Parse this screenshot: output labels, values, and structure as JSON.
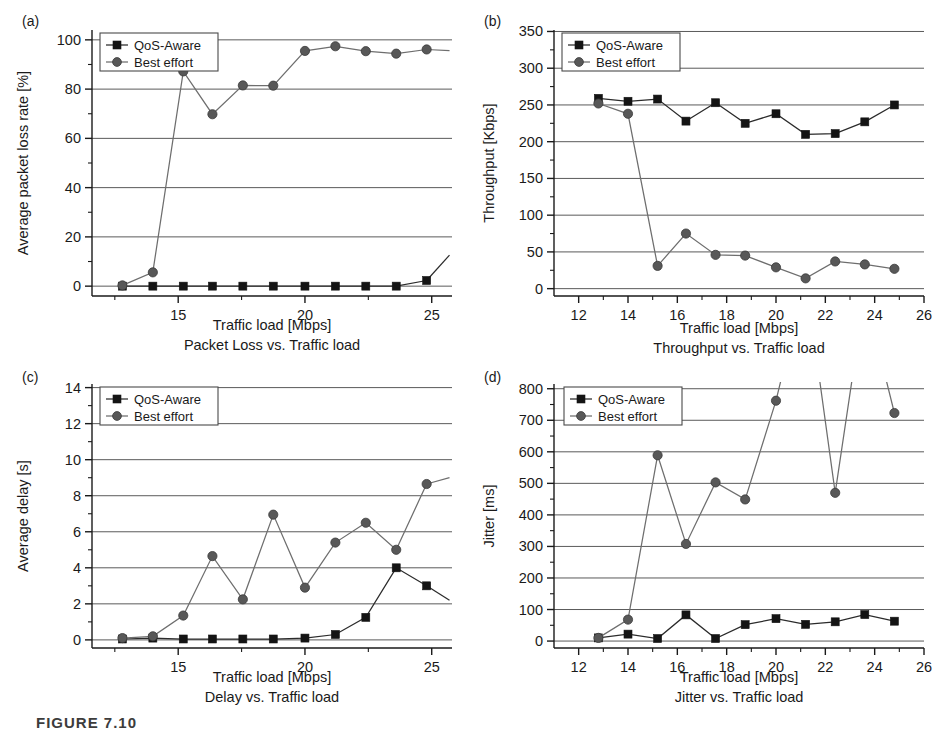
{
  "figure": {
    "caption_partial": "FIGURE 7.10",
    "series_names": [
      "QoS-Aware",
      "Best effort"
    ],
    "colors": {
      "qos_aware_marker": "#141414",
      "best_effort_marker": "#585858",
      "gridline": "#5a5a5a",
      "axis": "#1a1a1a",
      "background": "#ffffff"
    }
  },
  "chart_data": [
    {
      "id": "panel-a",
      "panel_tag": "(a)",
      "type": "line",
      "title": "",
      "sub_caption": "Packet Loss vs. Traffic load",
      "xlabel": "Traffic load [Mbps]",
      "ylabel": "Average packet loss rate [%]",
      "xlim": [
        11.6,
        25.8
      ],
      "ylim": [
        -4,
        104
      ],
      "xticks": [
        15,
        20,
        25
      ],
      "xtick_labels": [
        "15",
        "20",
        "25"
      ],
      "xminor": [
        12.5,
        17.5,
        22.5
      ],
      "yticks": [
        0,
        20,
        40,
        60,
        80,
        100
      ],
      "ytick_labels": [
        "0",
        "20",
        "40",
        "60",
        "80",
        "100"
      ],
      "yminor": [
        10,
        30,
        50,
        70,
        90
      ],
      "grid": true,
      "legend_position": "top-left",
      "x": [
        12.8,
        14.0,
        15.2,
        16.35,
        17.55,
        18.75,
        20.0,
        21.2,
        22.4,
        23.6,
        24.8
      ],
      "series": [
        {
          "name": "QoS-Aware",
          "marker": "square",
          "values": [
            0,
            0,
            0,
            0,
            0,
            0,
            0,
            0,
            0,
            0,
            2.3
          ]
        },
        {
          "name": "Best effort",
          "marker": "circle",
          "values": [
            0.3,
            5.6,
            87.2,
            69.8,
            81.5,
            81.4,
            95.5,
            97.4,
            95.4,
            94.4,
            96.1
          ]
        }
      ],
      "extra_segments": [
        {
          "series": "QoS-Aware",
          "note": "rises off panel after last point",
          "x": [
            24.8,
            25.7
          ],
          "y": [
            2.3,
            12.6
          ]
        },
        {
          "series": "Best effort",
          "note": "continues to right edge",
          "x": [
            24.8,
            25.7
          ],
          "y": [
            96.1,
            95.6
          ]
        }
      ]
    },
    {
      "id": "panel-b",
      "panel_tag": "(b)",
      "type": "line",
      "title": "",
      "sub_caption": "Throughput vs. Traffic load",
      "xlabel": "Traffic load [Mbps]",
      "ylabel": "Throughput [Kbps]",
      "xlim": [
        11.0,
        26.0
      ],
      "ylim": [
        -10,
        352
      ],
      "xticks": [
        12,
        14,
        16,
        18,
        20,
        22,
        24,
        26
      ],
      "xtick_labels": [
        "12",
        "14",
        "16",
        "18",
        "20",
        "22",
        "24",
        "26"
      ],
      "xminor": [
        13,
        15,
        17,
        19,
        21,
        23,
        25
      ],
      "yticks": [
        0,
        50,
        100,
        150,
        200,
        250,
        300,
        350
      ],
      "ytick_labels": [
        "0",
        "50",
        "100",
        "150",
        "200",
        "250",
        "300",
        "350"
      ],
      "yminor": [
        25,
        75,
        125,
        175,
        225,
        275,
        325
      ],
      "grid": true,
      "legend_position": "top-left",
      "x": [
        12.8,
        14.0,
        15.2,
        16.35,
        17.55,
        18.75,
        20.0,
        21.2,
        22.4,
        23.6,
        24.8
      ],
      "series": [
        {
          "name": "QoS-Aware",
          "marker": "square",
          "values": [
            259,
            255,
            258,
            228,
            253,
            225,
            238,
            210,
            211,
            227,
            250
          ]
        },
        {
          "name": "Best effort",
          "marker": "circle",
          "values": [
            252,
            238,
            31,
            75,
            46,
            45,
            29,
            14,
            37,
            33,
            27
          ]
        }
      ],
      "extra_segments": []
    },
    {
      "id": "panel-c",
      "panel_tag": "(c)",
      "type": "line",
      "title": "",
      "sub_caption": "Delay vs. Traffic load",
      "xlabel": "Traffic load [Mbps]",
      "ylabel": "Average delay [s]",
      "xlim": [
        11.6,
        25.8
      ],
      "ylim": [
        -0.45,
        14.2
      ],
      "xticks": [
        15,
        20,
        25
      ],
      "xtick_labels": [
        "15",
        "20",
        "25"
      ],
      "xminor": [
        12.5,
        17.5,
        22.5
      ],
      "yticks": [
        0,
        2,
        4,
        6,
        8,
        10,
        12,
        14
      ],
      "ytick_labels": [
        "0",
        "2",
        "4",
        "6",
        "8",
        "10",
        "12",
        "14"
      ],
      "yminor": [
        1,
        3,
        5,
        7,
        9,
        11,
        13
      ],
      "grid": true,
      "legend_position": "top-left",
      "x": [
        12.8,
        14.0,
        15.2,
        16.35,
        17.55,
        18.75,
        20.0,
        21.2,
        22.4,
        23.6,
        24.8
      ],
      "series": [
        {
          "name": "QoS-Aware",
          "marker": "square",
          "values": [
            0.05,
            0.1,
            0.05,
            0.05,
            0.05,
            0.05,
            0.1,
            0.3,
            1.25,
            4.0,
            3.0
          ]
        },
        {
          "name": "Best effort",
          "marker": "circle",
          "values": [
            0.1,
            0.2,
            1.35,
            4.65,
            2.25,
            6.95,
            2.9,
            5.4,
            6.5,
            5.0,
            8.65
          ]
        }
      ],
      "extra_segments": [
        {
          "series": "QoS-Aware",
          "note": "falls toward right edge",
          "x": [
            24.8,
            25.7
          ],
          "y": [
            3.0,
            2.2
          ]
        },
        {
          "series": "Best effort",
          "note": "continues up to right edge",
          "x": [
            24.8,
            25.7
          ],
          "y": [
            8.65,
            9.0
          ]
        }
      ]
    },
    {
      "id": "panel-d",
      "panel_tag": "(d)",
      "type": "line",
      "title": "",
      "sub_caption": "Jitter vs. Traffic load",
      "xlabel": "Traffic load [Mbps]",
      "ylabel": "Jitter [ms]",
      "xlim": [
        11.0,
        26.0
      ],
      "ylim": [
        -22,
        815
      ],
      "xticks": [
        12,
        14,
        16,
        18,
        20,
        22,
        24,
        26
      ],
      "xtick_labels": [
        "12",
        "14",
        "16",
        "18",
        "20",
        "22",
        "24",
        "26"
      ],
      "xminor": [
        13,
        15,
        17,
        19,
        21,
        23,
        25
      ],
      "yticks": [
        0,
        100,
        200,
        300,
        400,
        500,
        600,
        700,
        800
      ],
      "ytick_labels": [
        "0",
        "100",
        "200",
        "300",
        "400",
        "500",
        "600",
        "700",
        "800"
      ],
      "yminor": [
        50,
        150,
        250,
        350,
        450,
        550,
        650,
        750
      ],
      "grid": true,
      "legend_position": "top-left",
      "clipped_note": "Best effort exceeds 800 ms between 20 and 24 Mbps; lines run off the top of the panel",
      "x": [
        12.8,
        14.0,
        15.2,
        16.35,
        17.55,
        18.75,
        20.0,
        21.2,
        22.4,
        23.6,
        24.8
      ],
      "series": [
        {
          "name": "QoS-Aware",
          "marker": "square",
          "values": [
            10,
            22,
            8,
            83,
            8,
            52,
            71,
            53,
            61,
            84,
            63
          ]
        },
        {
          "name": "Best effort",
          "marker": "circle",
          "values": [
            10,
            68,
            589,
            308,
            503,
            449,
            762,
            1150,
            470,
            1100,
            723
          ]
        }
      ],
      "extra_segments": []
    }
  ]
}
